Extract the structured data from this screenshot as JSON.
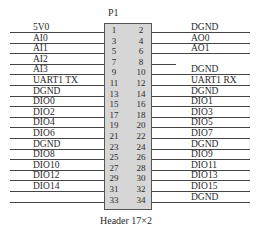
{
  "component": {
    "reference": "P1",
    "caption": "Header 17×2"
  },
  "left_pins": [
    {
      "pin": "1",
      "net": "5V0"
    },
    {
      "pin": "3",
      "net": "AI0"
    },
    {
      "pin": "5",
      "net": "AI1"
    },
    {
      "pin": "7",
      "net": "AI2"
    },
    {
      "pin": "9",
      "net": "AI3"
    },
    {
      "pin": "11",
      "net": "UART1 TX"
    },
    {
      "pin": "13",
      "net": "DGND"
    },
    {
      "pin": "15",
      "net": "DIO0"
    },
    {
      "pin": "17",
      "net": "DIO2"
    },
    {
      "pin": "19",
      "net": "DIO4"
    },
    {
      "pin": "21",
      "net": "DIO6"
    },
    {
      "pin": "23",
      "net": "DGND"
    },
    {
      "pin": "25",
      "net": "DIO8"
    },
    {
      "pin": "27",
      "net": "DIO10"
    },
    {
      "pin": "29",
      "net": "DIO12"
    },
    {
      "pin": "31",
      "net": "DIO14"
    },
    {
      "pin": "33",
      "net": ""
    }
  ],
  "right_pins": [
    {
      "pin": "2",
      "net": "DGND"
    },
    {
      "pin": "4",
      "net": "AO0"
    },
    {
      "pin": "6",
      "net": "AO1"
    },
    {
      "pin": "8",
      "net": "",
      "short_wire": true
    },
    {
      "pin": "10",
      "net": "DGND"
    },
    {
      "pin": "12",
      "net": "UART1 RX"
    },
    {
      "pin": "14",
      "net": "DGND"
    },
    {
      "pin": "16",
      "net": "DIO1"
    },
    {
      "pin": "18",
      "net": "DIO3"
    },
    {
      "pin": "20",
      "net": "DIO5"
    },
    {
      "pin": "22",
      "net": "DIO7"
    },
    {
      "pin": "24",
      "net": "DGND"
    },
    {
      "pin": "26",
      "net": "DIO9"
    },
    {
      "pin": "28",
      "net": "DIO11"
    },
    {
      "pin": "30",
      "net": "DIO13"
    },
    {
      "pin": "32",
      "net": "DIO15"
    },
    {
      "pin": "34",
      "net": "DGND"
    }
  ]
}
